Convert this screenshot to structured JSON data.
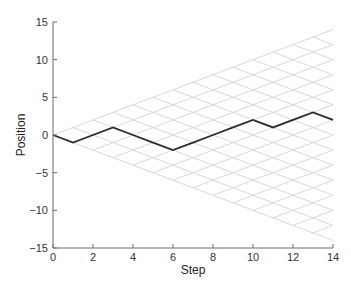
{
  "chart_data": {
    "type": "line",
    "title": "",
    "xlabel": "Step",
    "ylabel": "Position",
    "xlim": [
      0,
      14
    ],
    "ylim": [
      -15,
      15
    ],
    "xticks": [
      0,
      2,
      4,
      6,
      8,
      10,
      12,
      14
    ],
    "yticks": [
      -15,
      -10,
      -5,
      0,
      5,
      10,
      15
    ],
    "xtick_labels": [
      "0",
      "2",
      "4",
      "6",
      "8",
      "10",
      "12",
      "14"
    ],
    "ytick_labels": [
      "−15",
      "−10",
      "−5",
      "0",
      "5",
      "10",
      "15"
    ],
    "grid": false,
    "lattice": {
      "description": "random-walk reachable lattice, steps of ±1",
      "max_step": 14,
      "color": "#d2d2d2"
    },
    "series": [
      {
        "name": "walk",
        "color": "#2b2b2b",
        "x": [
          0,
          1,
          2,
          3,
          4,
          5,
          6,
          7,
          8,
          9,
          10,
          11,
          12,
          13,
          14
        ],
        "y": [
          0,
          -1,
          0,
          1,
          0,
          -1,
          -2,
          -1,
          0,
          1,
          2,
          1,
          2,
          3,
          2
        ]
      }
    ],
    "legend": "none"
  }
}
